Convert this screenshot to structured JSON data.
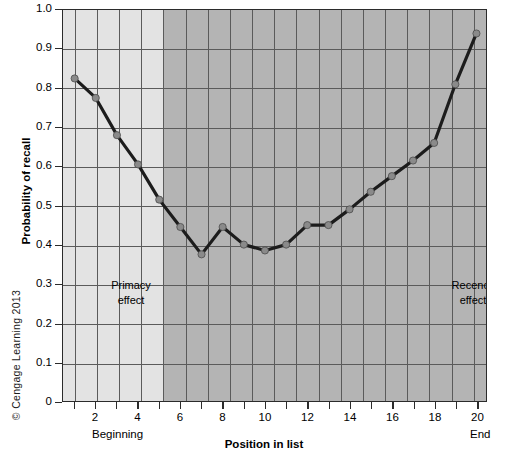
{
  "figure": {
    "copyright": "© Cengage Learning 2013"
  },
  "chart_data": {
    "type": "line",
    "title": "",
    "xlabel": "Position in list",
    "ylabel": "Probability of recall",
    "x": [
      1,
      2,
      3,
      4,
      5,
      6,
      7,
      8,
      9,
      10,
      11,
      12,
      13,
      14,
      15,
      16,
      17,
      18,
      19,
      20
    ],
    "values": [
      0.825,
      0.775,
      0.68,
      0.605,
      0.515,
      0.445,
      0.375,
      0.445,
      0.4,
      0.385,
      0.4,
      0.45,
      0.45,
      0.49,
      0.535,
      0.575,
      0.615,
      0.66,
      0.81,
      0.94
    ],
    "series": [
      {
        "name": "Probability of recall",
        "values": [
          0.825,
          0.775,
          0.68,
          0.605,
          0.515,
          0.445,
          0.375,
          0.445,
          0.4,
          0.385,
          0.4,
          0.45,
          0.45,
          0.49,
          0.535,
          0.575,
          0.615,
          0.66,
          0.81,
          0.94
        ]
      }
    ],
    "xlim": [
      0.45,
      20.45
    ],
    "ylim": [
      0,
      1.0
    ],
    "ytick_labels": [
      "1.0",
      "0.9",
      "0.8",
      "0.7",
      "0.6",
      "0.5",
      "0.4",
      "0.3",
      "0.2",
      "0.1",
      "0"
    ],
    "ytick_values": [
      1.0,
      0.9,
      0.8,
      0.7,
      0.6,
      0.5,
      0.4,
      0.3,
      0.2,
      0.1,
      0
    ],
    "xtick_values": [
      1,
      2,
      3,
      4,
      5,
      6,
      7,
      8,
      9,
      10,
      11,
      12,
      13,
      14,
      15,
      16,
      17,
      18,
      19,
      20
    ],
    "xtick_labels": [
      "",
      "2",
      "",
      "4",
      "",
      "6",
      "",
      "8",
      "",
      "10",
      "",
      "12",
      "",
      "14",
      "",
      "16",
      "",
      "18",
      "",
      "20"
    ],
    "grid": true,
    "legend_position": "none",
    "annotations": [
      {
        "name": "primacy",
        "line1": "Primacy",
        "line2": "effect"
      },
      {
        "name": "recency",
        "line1": "Recency",
        "line2": "effect"
      }
    ],
    "axis_end_labels": {
      "left": "Beginning",
      "right": "End"
    },
    "shaded_regions": [
      {
        "name": "primacy-band",
        "from": 0.45,
        "to": 5.0,
        "color": "#e3e3e3"
      },
      {
        "name": "remainder-band",
        "from": 5.0,
        "to": 20.45,
        "color": "#b4b4b4"
      }
    ],
    "colors": {
      "line": "#1c1c1c",
      "marker": "#8a8a8a",
      "grid": "#5b5b5b",
      "frame": "#2b2b2b"
    }
  }
}
